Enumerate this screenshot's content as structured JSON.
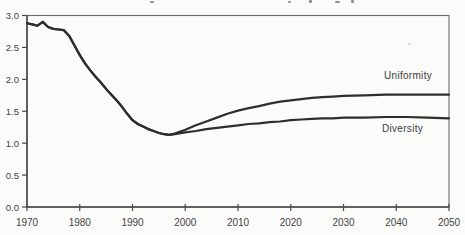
{
  "chart_data": {
    "type": "line",
    "title": "",
    "xlabel": "",
    "ylabel": "",
    "xlim": [
      1970,
      2050
    ],
    "ylim": [
      0.0,
      3.0
    ],
    "x_ticks": [
      1970,
      1980,
      1990,
      2000,
      2010,
      2020,
      2030,
      2040,
      2050
    ],
    "y_ticks": [
      0.0,
      0.5,
      1.0,
      1.5,
      2.0,
      2.5,
      3.0
    ],
    "y_tick_decimals": 1,
    "grid": false,
    "legend_position": "inline-labels-right",
    "line_color": "#2e2e2e",
    "axis_color": "#6b6b6b",
    "tick_color": "#4a4a4a",
    "label_color": "#3d3d3d",
    "background_color": "#fbfbf9",
    "series": [
      {
        "name": "Uniformity",
        "x": [
          1970,
          1971,
          1972,
          1973,
          1974,
          1975,
          1976,
          1977,
          1978,
          1979,
          1980,
          1981,
          1982,
          1983,
          1984,
          1985,
          1986,
          1987,
          1988,
          1989,
          1990,
          1991,
          1992,
          1993,
          1994,
          1995,
          1996,
          1997,
          1998,
          2000,
          2002,
          2004,
          2006,
          2008,
          2010,
          2012,
          2014,
          2016,
          2018,
          2020,
          2022,
          2024,
          2026,
          2028,
          2030,
          2034,
          2038,
          2042,
          2046,
          2050
        ],
        "y": [
          2.88,
          2.86,
          2.84,
          2.9,
          2.82,
          2.79,
          2.78,
          2.77,
          2.68,
          2.53,
          2.38,
          2.25,
          2.14,
          2.04,
          1.95,
          1.85,
          1.76,
          1.67,
          1.57,
          1.46,
          1.36,
          1.3,
          1.26,
          1.22,
          1.19,
          1.16,
          1.14,
          1.13,
          1.15,
          1.21,
          1.28,
          1.34,
          1.4,
          1.46,
          1.51,
          1.55,
          1.58,
          1.62,
          1.65,
          1.67,
          1.69,
          1.71,
          1.72,
          1.73,
          1.74,
          1.75,
          1.76,
          1.76,
          1.76,
          1.76
        ]
      },
      {
        "name": "Diversity",
        "x": [
          1970,
          1971,
          1972,
          1973,
          1974,
          1975,
          1976,
          1977,
          1978,
          1979,
          1980,
          1981,
          1982,
          1983,
          1984,
          1985,
          1986,
          1987,
          1988,
          1989,
          1990,
          1991,
          1992,
          1993,
          1994,
          1995,
          1996,
          1997,
          1998,
          2000,
          2002,
          2004,
          2006,
          2008,
          2010,
          2012,
          2014,
          2016,
          2018,
          2020,
          2022,
          2024,
          2026,
          2028,
          2030,
          2034,
          2038,
          2042,
          2046,
          2050
        ],
        "y": [
          2.88,
          2.86,
          2.84,
          2.9,
          2.82,
          2.79,
          2.78,
          2.77,
          2.68,
          2.53,
          2.38,
          2.25,
          2.14,
          2.04,
          1.95,
          1.85,
          1.76,
          1.67,
          1.57,
          1.46,
          1.36,
          1.3,
          1.26,
          1.22,
          1.19,
          1.16,
          1.14,
          1.13,
          1.14,
          1.17,
          1.19,
          1.22,
          1.24,
          1.26,
          1.28,
          1.3,
          1.31,
          1.33,
          1.34,
          1.36,
          1.37,
          1.38,
          1.39,
          1.39,
          1.4,
          1.4,
          1.41,
          1.41,
          1.4,
          1.39
        ]
      }
    ]
  }
}
